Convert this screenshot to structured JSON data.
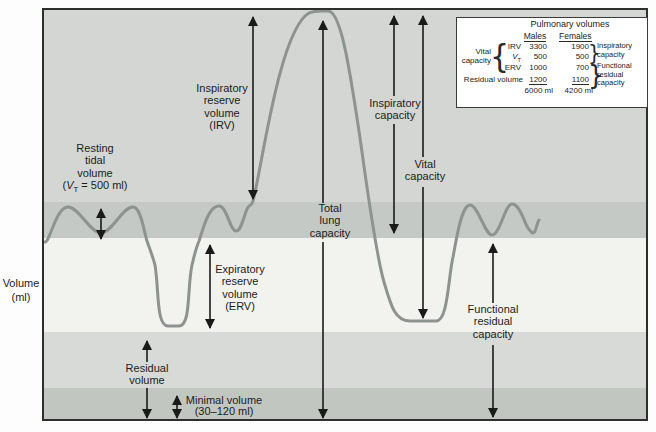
{
  "colors": {
    "band-a": "#d3d6d2",
    "band-b": "#c5c9c5",
    "band-c": "#f2f3ef",
    "band-d": "#d7dad6",
    "band-e": "#c2c6c1",
    "curve": "#8d938f",
    "arrow": "#1a1a1a",
    "text": "#1c1c1c",
    "frame": "#2e2e2e",
    "table-bg": "#ffffff"
  },
  "y_axis": {
    "label": "Volume\n(ml)"
  },
  "annotations": {
    "resting_tidal": {
      "text": "Resting\ntidal\nvolume",
      "vt_open": "(",
      "vt_var": "V",
      "vt_sub": "T",
      "vt_rest": " = 500 ml)"
    },
    "irv": "Inspiratory\nreserve\nvolume\n(IRV)",
    "total_lung_capacity": "Total\nlung\ncapacity",
    "inspiratory_capacity": "Inspiratory\ncapacity",
    "vital_capacity": "Vital\ncapacity",
    "erv": "Expiratory\nreserve\nvolume\n(ERV)",
    "functional_residual_capacity": "Functional\nresidual\ncapacity",
    "residual_volume": "Residual\nvolume",
    "minimal_volume": "Minimal volume\n(30–120 ml)"
  },
  "table": {
    "title": "Pulmonary volumes",
    "columns": {
      "males": "Males",
      "females": "Females"
    },
    "stub_vital_capacity": "Vital\ncapacity",
    "stub_residual_volume": "Residual volume",
    "rows": [
      {
        "label": "IRV",
        "males": "3300",
        "females": "1900"
      },
      {
        "label_var": "V",
        "label_sub": "T",
        "males": "500",
        "females": "500"
      },
      {
        "label": "ERV",
        "males": "1000",
        "females": "700"
      },
      {
        "males": "1200",
        "females": "1100"
      }
    ],
    "totals": {
      "males": "6000 ml",
      "females": "4200 ml"
    },
    "notes": {
      "inspiratory_capacity": "Inspiratory\ncapacity",
      "functional_residual_capacity": "Functional\nresidual\ncapacity"
    },
    "braces": {
      "left": "{",
      "right_top": "}",
      "right_bottom": "}"
    }
  }
}
